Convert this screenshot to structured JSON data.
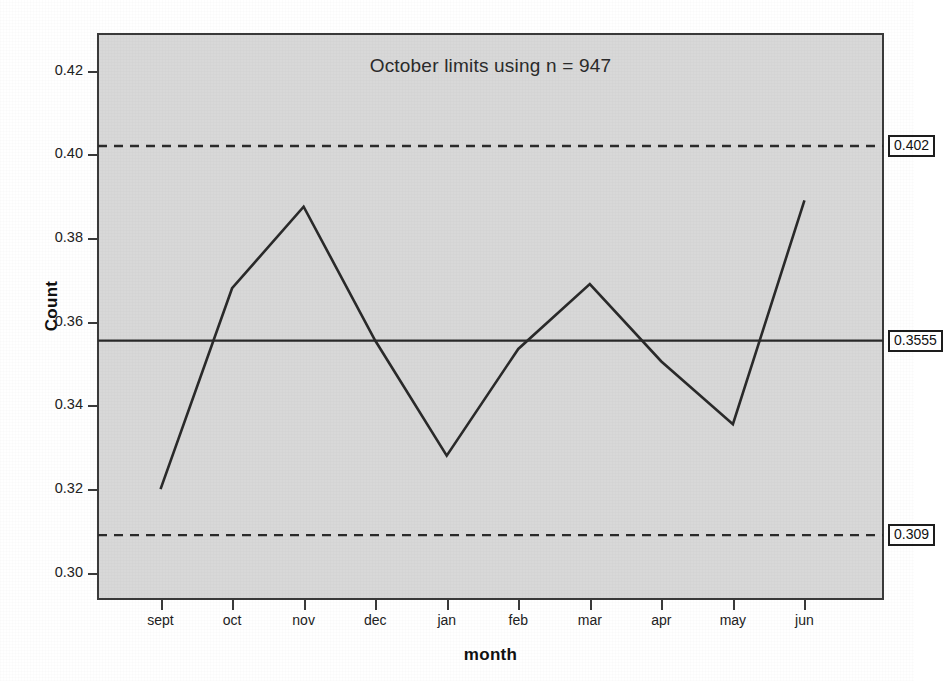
{
  "chart_data": {
    "type": "line",
    "title": "October limits using n = 947",
    "xlabel": "month",
    "ylabel": "Count",
    "categories": [
      "sept",
      "oct",
      "nov",
      "dec",
      "jan",
      "feb",
      "mar",
      "apr",
      "may",
      "jun"
    ],
    "values": [
      0.32,
      0.368,
      0.3875,
      0.3555,
      0.328,
      0.3535,
      0.369,
      0.3505,
      0.3355,
      0.389
    ],
    "series": [
      {
        "name": "Count",
        "values": [
          0.32,
          0.368,
          0.3875,
          0.3555,
          0.328,
          0.3535,
          0.369,
          0.3505,
          0.3355,
          0.389
        ]
      }
    ],
    "ylim": [
      0.2935,
      0.429
    ],
    "ytick_labels": [
      "0.42",
      "0.40",
      "0.38",
      "0.36",
      "0.34",
      "0.32",
      "0.30"
    ],
    "ytick_values": [
      0.42,
      0.4,
      0.38,
      0.36,
      0.34,
      0.32,
      0.3
    ],
    "grid": false,
    "legend": "none",
    "plot_background": "#d8d8d8",
    "page_background": "#ffffff",
    "line_color": "#2a2a2a",
    "reference_lines": [
      {
        "name": "upper-control-limit",
        "label": "0.402",
        "value": 0.402,
        "style": "dashed"
      },
      {
        "name": "center-line",
        "label": "0.3555",
        "value": 0.3555,
        "style": "solid"
      },
      {
        "name": "lower-control-limit",
        "label": "0.309",
        "value": 0.309,
        "style": "dashed"
      }
    ]
  }
}
